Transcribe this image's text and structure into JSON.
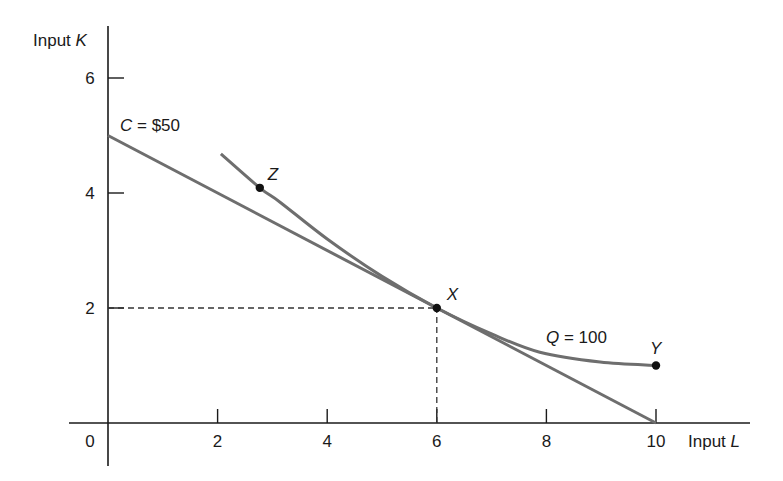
{
  "chart_data": {
    "type": "line",
    "title": "",
    "xlabel": "Input L",
    "ylabel": "Input K",
    "xlabel_parts": {
      "prefix": "Input ",
      "var": "L"
    },
    "ylabel_parts": {
      "prefix": "Input ",
      "var": "K"
    },
    "xlim": [
      0,
      10
    ],
    "ylim": [
      0,
      6.5
    ],
    "x_ticks": [
      0,
      2,
      4,
      6,
      8,
      10
    ],
    "y_ticks": [
      2,
      4,
      6
    ],
    "grid": false,
    "series": [
      {
        "name": "C = $50",
        "kind": "isocost line",
        "label_parts": {
          "var": "C",
          "rest": " = $50"
        },
        "color": "#6e6e6e",
        "points": [
          [
            0,
            5
          ],
          [
            10,
            0
          ]
        ]
      },
      {
        "name": "Q = 100",
        "kind": "isoquant curve",
        "label_parts": {
          "var": "Q",
          "rest": " = 100"
        },
        "color": "#6e6e6e",
        "points": [
          [
            2.06,
            4.68
          ],
          [
            2.77,
            4.09
          ],
          [
            3.14,
            3.84
          ],
          [
            4.0,
            3.2
          ],
          [
            5.0,
            2.55
          ],
          [
            6.0,
            2.0
          ],
          [
            7.0,
            1.55
          ],
          [
            7.88,
            1.23
          ],
          [
            8.98,
            1.06
          ],
          [
            10.0,
            1.0
          ]
        ]
      }
    ],
    "points": [
      {
        "label": "Z",
        "x": 2.77,
        "y": 4.09
      },
      {
        "label": "X",
        "x": 6,
        "y": 2
      },
      {
        "label": "Y",
        "x": 10,
        "y": 1
      }
    ],
    "annotations": [
      {
        "type": "dashed-guide",
        "from": [
          0,
          2
        ],
        "to": [
          6,
          2
        ]
      },
      {
        "type": "dashed-guide",
        "from": [
          6,
          0
        ],
        "to": [
          6,
          2
        ]
      }
    ]
  }
}
